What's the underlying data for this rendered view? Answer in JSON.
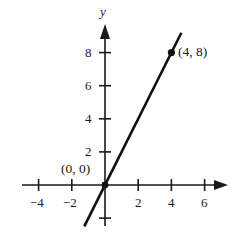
{
  "figure": {
    "width": 232,
    "height": 236,
    "background": "#ffffff",
    "ink_color": "#1a1a1a"
  },
  "chart_data": {
    "type": "line",
    "title": "",
    "subtitle": "",
    "xlabel": "",
    "ylabel": "y",
    "axis_labels": {
      "x": "",
      "y": "y"
    },
    "grid": false,
    "legend": null,
    "legend_position": "none",
    "xlim": [
      -5.1,
      7.6
    ],
    "ylim": [
      -3.0,
      9.7
    ],
    "xticks": [
      -4,
      -2,
      2,
      4,
      6
    ],
    "yticks": [
      2,
      4,
      6,
      8
    ],
    "xtick_labels": [
      "−4",
      "−2",
      "2",
      "4",
      "6"
    ],
    "ytick_labels": [
      "8",
      "6",
      "4",
      "2"
    ],
    "minor_ticks": {
      "y_below_origin": [
        -2
      ]
    },
    "origin_label": "(0, 0)",
    "series": [
      {
        "name": "y = 2x",
        "type": "line",
        "equation": "y = 2x",
        "slope": 2,
        "intercept": 0,
        "color": "#111111",
        "linewidth": 2.6,
        "x": [
          -1.25,
          4.6
        ],
        "y": [
          -2.5,
          9.2
        ],
        "endpoints": [
          {
            "x": -1.25,
            "y": -2.5
          },
          {
            "x": 4.6,
            "y": 9.2
          }
        ]
      }
    ],
    "points": [
      {
        "x": 0,
        "y": 0,
        "label": "(0, 0)",
        "marker": "dot",
        "label_position": "above-left"
      },
      {
        "x": 4,
        "y": 8,
        "label": "(4, 8)",
        "marker": "dot",
        "label_position": "right"
      }
    ],
    "annotations": [
      {
        "text": "(0, 0)",
        "x": 0,
        "y": 0
      },
      {
        "text": "(4, 8)",
        "x": 4,
        "y": 8
      }
    ],
    "arrows": {
      "x_positive": true,
      "x_negative": false,
      "y_positive": true,
      "y_negative": false
    }
  },
  "labels": {
    "y_axis": "y",
    "origin_point": "(0, 0)",
    "plotted_point": "(4, 8)",
    "x_ticks": [
      "−4",
      "−2",
      "2",
      "4",
      "6"
    ],
    "y_ticks": [
      "8",
      "6",
      "4",
      "2"
    ]
  }
}
